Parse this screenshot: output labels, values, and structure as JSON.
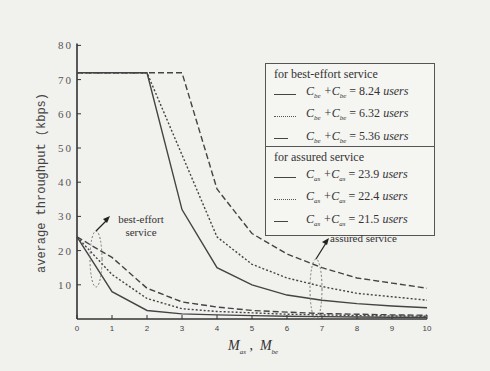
{
  "chart_data": {
    "type": "line",
    "title": "",
    "xlabel": "M_as , M_be",
    "ylabel": "average throughput (kbps)",
    "xlim": [
      0,
      10
    ],
    "ylim": [
      0,
      80
    ],
    "x_ticks": [
      "0",
      "1",
      "2",
      "3",
      "4",
      "5",
      "6",
      "7",
      "8",
      "9",
      "10"
    ],
    "y_ticks": [
      "10",
      "20",
      "30",
      "40",
      "50",
      "60",
      "70",
      "80"
    ],
    "grid": false,
    "legend_position": "upper right",
    "x": [
      0,
      1,
      2,
      3,
      4,
      5,
      6,
      7,
      8,
      9,
      10
    ],
    "series": [
      {
        "name": "assured: C_as + C_be = 23.9 users",
        "style": "solid",
        "group": "assured",
        "values": [
          72,
          72,
          72,
          32,
          15,
          10,
          7,
          5.5,
          4.5,
          3.8,
          3.3
        ]
      },
      {
        "name": "assured: C_as + C_be = 22.4 users",
        "style": "dotted",
        "group": "assured",
        "values": [
          72,
          72,
          72,
          48,
          24,
          16,
          12,
          9.5,
          7.5,
          6.5,
          5.5
        ]
      },
      {
        "name": "assured: C_as + C_be = 21.5 users",
        "style": "dashed",
        "group": "assured",
        "values": [
          72,
          72,
          72,
          72,
          38,
          25,
          19,
          15,
          12,
          10.5,
          9
        ]
      },
      {
        "name": "best-effort: C_as + C_be = 8.24 users",
        "style": "solid",
        "group": "best-effort",
        "values": [
          24,
          8,
          2.5,
          1.5,
          1.2,
          1,
          0.8,
          0.7,
          0.6,
          0.5,
          0.5
        ]
      },
      {
        "name": "best-effort: C_as + C_be = 6.32 users",
        "style": "dotted",
        "group": "best-effort",
        "values": [
          24,
          13,
          6,
          3,
          2.2,
          1.8,
          1.4,
          1.2,
          1,
          0.9,
          0.8
        ]
      },
      {
        "name": "best-effort: C_as + C_be = 5.36 users",
        "style": "dashed",
        "group": "best-effort",
        "values": [
          24,
          18,
          9,
          5,
          3.5,
          2.5,
          2,
          1.6,
          1.4,
          1.2,
          1.1
        ]
      }
    ],
    "annotations": [
      "best-effort service",
      "assured service"
    ]
  },
  "labels": {
    "ylabel": "average throughput (kbps)",
    "xlabel_main1": "M",
    "xlabel_sub1": "as",
    "xlabel_sep": " ,  ",
    "xlabel_main2": "M",
    "xlabel_sub2": "be"
  },
  "legend_be": {
    "title": "for best-effort service",
    "rows": [
      {
        "style": "solid",
        "s1": "be",
        "s2": "be",
        "value": "= 8.24",
        "unit": "users"
      },
      {
        "style": "dotted",
        "s1": "be",
        "s2": "be",
        "value": "= 6.32",
        "unit": "users"
      },
      {
        "style": "dashed",
        "s1": "be",
        "s2": "be",
        "value": "= 5.36",
        "unit": "users"
      }
    ]
  },
  "legend_as": {
    "title": "for assured service",
    "rows": [
      {
        "style": "solid",
        "s1": "as",
        "s2": "as",
        "value": "= 23.9",
        "unit": "users"
      },
      {
        "style": "dotted",
        "s1": "as",
        "s2": "as",
        "value": "= 22.4",
        "unit": "users"
      },
      {
        "style": "dashed",
        "s1": "as",
        "s2": "as",
        "value": "= 21.5",
        "unit": "users"
      }
    ]
  },
  "annotations": {
    "best_effort_line1": "best-effort",
    "best_effort_line2": "service",
    "assured": "assured service"
  }
}
